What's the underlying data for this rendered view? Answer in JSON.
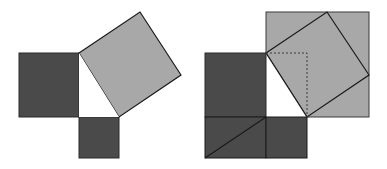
{
  "diagram": {
    "colors": {
      "dark": "#4a4a4a",
      "light": "#a8a8a8",
      "background": "#ffffff",
      "stroke": "#1a1a1a"
    },
    "figures": [
      {
        "name": "left-figure",
        "shapes": [
          "square-on-leg-a",
          "square-on-leg-b",
          "square-on-hypotenuse",
          "right-triangle"
        ]
      },
      {
        "name": "right-figure",
        "shapes": [
          "large-outer-square",
          "rotated-hypotenuse-square",
          "rearranged-leg-squares",
          "dotted-guides"
        ]
      }
    ]
  }
}
